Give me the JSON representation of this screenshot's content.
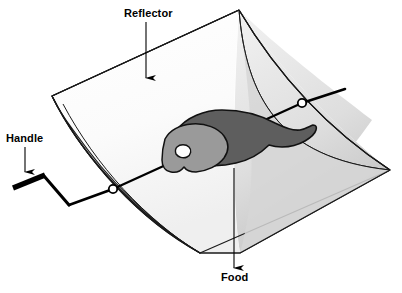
{
  "figure": {
    "type": "technical-line-diagram",
    "width": 402,
    "height": 293,
    "background_color": "#ffffff"
  },
  "labels": {
    "reflector": "Reflector",
    "handle": "Handle",
    "food": "Food"
  },
  "callouts": [
    {
      "id": "reflector",
      "text": "Reflector",
      "text_x": 124,
      "text_y": 7,
      "arrow_from": [
        146,
        22
      ],
      "arrow_to": [
        146,
        86
      ],
      "arrow_direction": "down",
      "points_to": "curved-reflector-trough-surface"
    },
    {
      "id": "handle",
      "text": "Handle",
      "text_x": 6,
      "text_y": 132,
      "arrow_from": [
        25,
        148
      ],
      "arrow_to": [
        25,
        180
      ],
      "arrow_direction": "down",
      "points_to": "crank-handle-grip"
    },
    {
      "id": "food",
      "text": "Food",
      "text_x": 221,
      "text_y": 271,
      "arrow_from": [
        234,
        268
      ],
      "arrow_to": [
        234,
        158
      ],
      "arrow_direction": "up",
      "points_to": "roast-on-spit"
    }
  ],
  "parts": {
    "reflector": {
      "name": "Reflector",
      "description": "Parabolic trough reflector shown in isometric view",
      "outline_color": "#1a1a1a",
      "inner_surface_color": "#ffffff",
      "inner_shade_color": "#ebebeb",
      "endcap_color": "#a8a8a8",
      "far_endcap_color": "#c9c9c9",
      "stroke_width": 1.1
    },
    "spit": {
      "name": "Spit rod",
      "description": "Rod running through the food from the crank on the left to the bearing on the right",
      "color": "#000000",
      "stroke_width": 2.2,
      "left_end": [
        48,
        205
      ],
      "right_end": [
        345,
        89
      ]
    },
    "handle": {
      "name": "Handle",
      "description": "Z-shaped crank handle with thick grip bar at the left end",
      "color": "#000000",
      "grip_stroke_width": 5,
      "arm_stroke_width": 3,
      "grip_from": [
        13,
        188
      ],
      "grip_to": [
        44,
        176
      ]
    },
    "bearings": [
      {
        "name": "near-bearing",
        "center": [
          113,
          189
        ],
        "radius": 4.2,
        "fill": "#ffffff",
        "stroke": "#000000"
      },
      {
        "name": "far-bearing",
        "center": [
          302,
          103
        ],
        "radius": 4.2,
        "fill": "#ffffff",
        "stroke": "#000000"
      }
    ],
    "food": {
      "name": "Food",
      "description": "Ham / roast joint skewered on the spit rod",
      "body_color": "#5e5e5e",
      "cut_face_color": "#9a9a9a",
      "bone_color": "#ffffff",
      "outline_color": "#111111",
      "bone_center": [
        182,
        151
      ]
    }
  },
  "colors": {
    "ink": "#1a1a1a",
    "paper": "#ffffff",
    "light_gray": "#ebebeb",
    "mid_gray": "#c9c9c9",
    "shade_gray": "#a8a8a8",
    "dark_gray": "#5e5e5e",
    "food_gray": "#9a9a9a"
  }
}
